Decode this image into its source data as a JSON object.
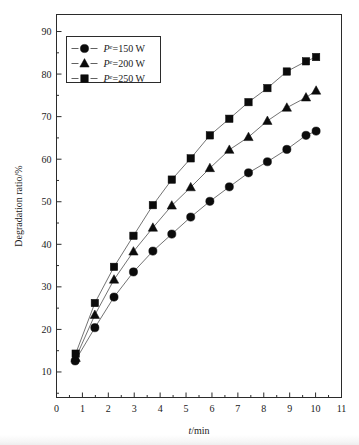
{
  "chart_data": {
    "type": "line",
    "title": "",
    "xlabel": "t/min",
    "ylabel": "Degradation ratio/%",
    "xlim": [
      0,
      11
    ],
    "ylim": [
      4,
      94
    ],
    "grid": false,
    "legend_position": "top-left",
    "xticks": [
      0,
      1,
      2,
      3,
      4,
      5,
      6,
      7,
      8,
      9,
      10,
      11
    ],
    "xtick_labels": [
      "0",
      "1",
      "2",
      "3",
      "4",
      "5",
      "6",
      "7",
      "8",
      "9",
      "10",
      "11"
    ],
    "yticks": [
      10,
      20,
      30,
      40,
      50,
      60,
      70,
      80,
      90
    ],
    "ytick_labels": [
      "10",
      "20",
      "30",
      "40",
      "50",
      "60",
      "70",
      "80",
      "90"
    ],
    "series": [
      {
        "name": "Pᵉ=150 W",
        "label_prefix": "P",
        "label_sup": "e",
        "label_rest": "=150 W",
        "marker": "circle",
        "x": [
          0.72,
          1.48,
          2.22,
          2.97,
          3.72,
          4.45,
          5.18,
          5.92,
          6.67,
          7.41,
          8.14,
          8.89,
          9.63,
          10.02
        ],
        "y": [
          12.6,
          20.4,
          27.6,
          33.5,
          38.4,
          42.4,
          46.4,
          50.1,
          53.5,
          56.8,
          59.4,
          62.3,
          65.6,
          66.6
        ]
      },
      {
        "name": "Pᵉ=200 W",
        "label_prefix": "P",
        "label_sup": "e",
        "label_rest": "=200 W",
        "marker": "triangle",
        "x": [
          0.74,
          1.48,
          2.22,
          2.97,
          3.72,
          4.45,
          5.18,
          5.92,
          6.67,
          7.41,
          8.14,
          8.89,
          9.63,
          10.02
        ],
        "y": [
          13.3,
          23.4,
          31.7,
          38.3,
          43.9,
          49.1,
          53.4,
          57.9,
          62.2,
          65.2,
          69.0,
          72.1,
          74.5,
          76.1
        ]
      },
      {
        "name": "Pᵉ=250 W",
        "label_prefix": "P",
        "label_sup": "e",
        "label_rest": "=250 W",
        "marker": "square",
        "x": [
          0.74,
          1.48,
          2.22,
          2.97,
          3.72,
          4.45,
          5.18,
          5.92,
          6.67,
          7.41,
          8.14,
          8.89,
          9.63,
          10.02
        ],
        "y": [
          14.3,
          26.2,
          34.7,
          42.0,
          49.2,
          55.2,
          60.2,
          65.6,
          69.5,
          73.4,
          76.7,
          80.6,
          83.0,
          84.0
        ]
      }
    ]
  },
  "legend": {
    "entries": [
      {
        "label": "Pᵉ=150 W",
        "prefix": "P",
        "sup": "e",
        "rest": "=150 W",
        "marker": "circle"
      },
      {
        "label": "Pᵉ=200 W",
        "prefix": "P",
        "sup": "e",
        "rest": "=200 W",
        "marker": "triangle"
      },
      {
        "label": "Pᵉ=250 W",
        "prefix": "P",
        "sup": "e",
        "rest": "=250 W",
        "marker": "square"
      }
    ]
  },
  "axes": {
    "x_title_italic": "t",
    "x_title_rest": "/min",
    "y_title": "Degradation ratio/%"
  },
  "colors": {
    "marker": "#0b0b0b",
    "line": "#4f4f4f",
    "axis": "#2b2b2b",
    "background": "#ffffff"
  }
}
